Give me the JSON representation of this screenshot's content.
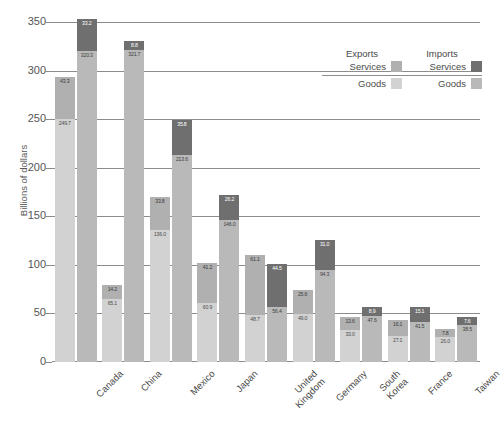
{
  "chart_data": {
    "type": "bar",
    "subtype": "grouped-stacked",
    "title": "",
    "xlabel": "",
    "ylabel": "Billions of dollars",
    "ylim": [
      0,
      350
    ],
    "yticks": [
      0,
      50,
      100,
      150,
      200,
      250,
      300,
      350
    ],
    "grid": true,
    "legend_position": "upper-right",
    "categories": [
      "Canada",
      "China",
      "Mexico",
      "Japan",
      "United Kingdom",
      "Germany",
      "South Korea",
      "France",
      "Taiwan"
    ],
    "series": [
      {
        "name": "Exports Goods",
        "values": [
          249.7,
          65.1,
          136.0,
          60.9,
          48.7,
          49.0,
          33.0,
          27.1,
          26.0
        ]
      },
      {
        "name": "Exports Services",
        "values": [
          43.3,
          14.2,
          33.8,
          41.2,
          61.1,
          25.6,
          13.6,
          16.1,
          7.8
        ]
      },
      {
        "name": "Imports Goods",
        "values": [
          320.3,
          321.7,
          213.6,
          146.0,
          56.4,
          94.3,
          47.6,
          41.5,
          38.5
        ]
      },
      {
        "name": "Imports Services",
        "values": [
          33.2,
          8.8,
          35.8,
          26.2,
          44.5,
          31.0,
          8.9,
          15.1,
          7.6
        ]
      }
    ]
  },
  "legend": {
    "exports_head": "Exports",
    "imports_head": "Imports",
    "services_label_left": "Services",
    "services_label_right": "Services",
    "goods_label_left": "Goods",
    "goods_label_right": "Goods"
  },
  "colors": {
    "exports_goods": "#d2d2d2",
    "exports_services": "#b0b0b0",
    "imports_goods": "#b9b9b9",
    "imports_services": "#6f6f6f",
    "axis": "#8c8c8c",
    "text": "#4a4a4a"
  }
}
